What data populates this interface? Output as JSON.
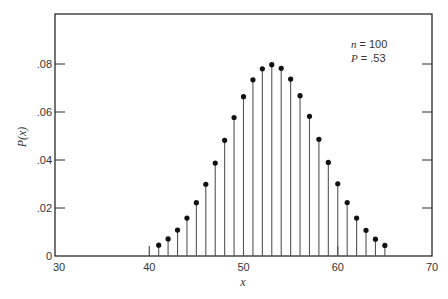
{
  "chart_data": {
    "type": "stem",
    "title": "",
    "xlabel": "x",
    "ylabel": "P(x)",
    "xlim": [
      30,
      70
    ],
    "ylim": [
      0,
      0.1
    ],
    "x_ticks": [
      30,
      40,
      50,
      60,
      70
    ],
    "x_tick_labels": [
      "30",
      "40",
      "50",
      "60",
      "70"
    ],
    "y_ticks": [
      0,
      0.02,
      0.04,
      0.06,
      0.08
    ],
    "y_tick_labels": [
      "0",
      ".02",
      ".04",
      ".06",
      ".08"
    ],
    "grid": false,
    "annotation": {
      "n_label": "n",
      "n_value": "= 100",
      "p_label": "P",
      "p_value": "= .53"
    },
    "x": [
      41,
      42,
      43,
      44,
      45,
      46,
      47,
      48,
      49,
      50,
      51,
      52,
      53,
      54,
      55,
      56,
      57,
      58,
      59,
      60,
      61,
      62,
      63,
      64,
      65
    ],
    "values": [
      0.0045,
      0.0071,
      0.0108,
      0.0158,
      0.0222,
      0.0299,
      0.0387,
      0.0482,
      0.0577,
      0.0664,
      0.0734,
      0.078,
      0.0797,
      0.0782,
      0.0737,
      0.0668,
      0.0582,
      0.0486,
      0.039,
      0.0301,
      0.0223,
      0.0158,
      0.0107,
      0.007,
      0.0044
    ]
  },
  "colors": {
    "axis": "#2a2a2a",
    "stem": "#555555",
    "marker": "#111111"
  }
}
